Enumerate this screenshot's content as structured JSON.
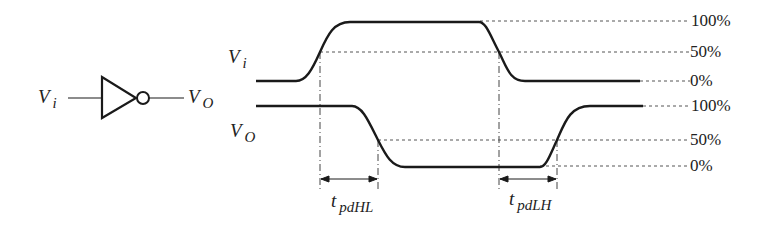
{
  "inverter": {
    "input_label": "V",
    "input_sub": "i",
    "output_label": "V",
    "output_sub": "O"
  },
  "waveforms": {
    "vi_label": "V",
    "vi_sub": "i",
    "vo_label": "V",
    "vo_sub": "O"
  },
  "levels": {
    "vi_100": "100%",
    "vi_50": "50%",
    "vi_0": "0%",
    "vo_100": "100%",
    "vo_50": "50%",
    "vo_0": "0%"
  },
  "delays": {
    "hl_t": "t",
    "hl_sub": "pdHL",
    "lh_t": "t",
    "lh_sub": "pdLH"
  },
  "colors": {
    "line": "#1a1a1a",
    "dashed": "#555555"
  }
}
